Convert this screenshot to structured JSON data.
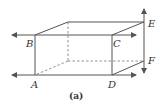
{
  "figure": {
    "caption": "(a)",
    "colors": {
      "line": "#555555",
      "text": "#333333",
      "background": "#ffffff"
    },
    "vertices": {
      "A": "A",
      "B": "B",
      "C": "C",
      "D": "D",
      "E": "E",
      "F": "F"
    }
  }
}
